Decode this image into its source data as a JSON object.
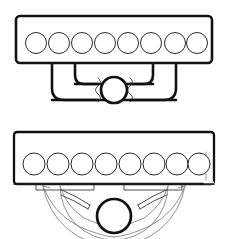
{
  "drawing": {
    "title": "Mechanical assembly line drawing",
    "style": "black-and-white technical patent illustration",
    "background_color": "#ffffff",
    "line_color": "#111111",
    "secondary_line_color": "#3a3a3a",
    "faint_line_color": "#7d7d7d",
    "canvas": {
      "width": 227,
      "height": 239
    }
  },
  "figures": [
    {
      "id": "figure-top",
      "label": "upper-assembly",
      "description": "Horizontal perforated bar with a nested bracket/yoke suspended beneath and a central hub shown with break lines",
      "bar": {
        "name": "perforated-bar",
        "x": 16,
        "y": 16,
        "width": 196,
        "height": 47,
        "corner_radius": 4,
        "hole_count": 8,
        "hole_radius": 10.5,
        "hole_center_y": 43,
        "hole_centers_x": [
          36,
          59,
          82,
          105,
          128,
          151,
          175,
          197
        ]
      },
      "bracket_outer": {
        "name": "outer-yoke",
        "left_x": 52,
        "right_x": 176,
        "top_y": 63,
        "bottom_y": 100,
        "corner_radius": 12
      },
      "bracket_inner": {
        "name": "inner-yoke",
        "left_x": 75,
        "right_x": 153,
        "top_y": 63,
        "bottom_y": 84,
        "corner_radius": 9
      },
      "hub": {
        "name": "center-hub",
        "cx": 114,
        "cy": 90,
        "r": 13
      },
      "break_lines": {
        "name": "break-line-pair",
        "left_x": 98,
        "right_x": 130,
        "top_y": 78,
        "bottom_y": 102
      }
    },
    {
      "id": "figure-bottom",
      "label": "lower-assembly",
      "description": "Horizontal perforated bar above a fan-shaped arc sweep with two curved blade markers and a central hub",
      "bar": {
        "name": "perforated-bar",
        "x": 14,
        "y": 132,
        "width": 200,
        "height": 52,
        "corner_radius": 3,
        "hole_count": 8,
        "hole_radius": 11,
        "hole_center_y": 164,
        "hole_centers_x": [
          34,
          58,
          82,
          106,
          130,
          154,
          177,
          199
        ]
      },
      "fan": {
        "name": "arc-sweep",
        "cx": 114,
        "cy": 186,
        "outer_radius": 72,
        "inner_radius": 54,
        "start_angle_deg": 8,
        "end_angle_deg": 172
      },
      "hub": {
        "name": "center-hub",
        "cx": 114,
        "cy": 216,
        "r": 17
      },
      "blade_markers": [
        {
          "name": "blade-marker-left",
          "side": "left"
        },
        {
          "name": "blade-marker-right",
          "side": "right"
        }
      ],
      "tabs": [
        {
          "name": "mount-tab-left",
          "x": 36,
          "width": 58
        },
        {
          "name": "mount-tab-right",
          "x": 124,
          "width": 58
        }
      ]
    }
  ]
}
